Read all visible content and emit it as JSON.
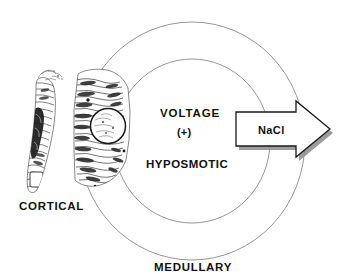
{
  "figure": {
    "title_visible": false,
    "background_color": "#ffffff",
    "width": 348,
    "height": 279
  },
  "labels": {
    "voltage": "VOLTAGE",
    "voltage_sign": "(+)",
    "hyposmotic": "HYPOSMOTIC",
    "cortical": "CORTICAL",
    "medullary": "MEDULLARY",
    "nacl": "NaCl"
  },
  "shapes": {
    "outer_ring_name": "outer-ellipse-ring",
    "inner_ring_name": "inner-ellipse-ring",
    "ring_stroke_color": "#8a8a8a",
    "arrow_name": "nacl-transport-arrow",
    "arrow_fill": "#ffffff",
    "arrow_stroke": "#1a1a1a",
    "arrow_shadow": "#8c8c8c",
    "arrow_direction": "right"
  },
  "cells": {
    "thin_cell_name": "cortical-thin-cell-sketch",
    "thick_cell_name": "medullary-thick-cell-sketch",
    "ink_color": "#2b2b2b",
    "nucleus_label": "nucleus-circle"
  }
}
